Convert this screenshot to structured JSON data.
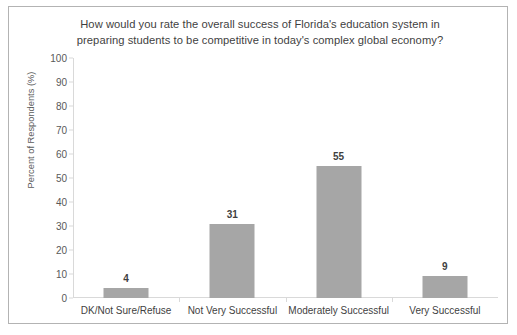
{
  "chart_data": {
    "type": "bar",
    "title": "How would you rate the overall success of Florida's education system in preparing students to be competitive in today's complex global economy?",
    "title_line1": "How would you rate the overall success of Florida's education system in",
    "title_line2": "preparing students to be competitive in today's complex global economy?",
    "categories": [
      "DK/Not Sure/Refuse",
      "Not Very Successful",
      "Moderately Successful",
      "Very Successful"
    ],
    "values": [
      4,
      31,
      55,
      9
    ],
    "value_labels": [
      "4",
      "31",
      "55",
      "9"
    ],
    "xlabel": "",
    "ylabel": "Percent of Respondents (%)",
    "ylim": [
      0,
      100
    ],
    "ytick_labels": [
      "100",
      "90",
      "80",
      "70",
      "60",
      "50",
      "40",
      "30",
      "20",
      "10",
      "0"
    ],
    "ytick_values": [
      100,
      90,
      80,
      70,
      60,
      50,
      40,
      30,
      20,
      10,
      0
    ],
    "grid": false,
    "legend": false,
    "legend_position": "none",
    "bar_color": "#a6a6a6",
    "axis_color": "#d9d9d9",
    "text_color": "#3f3f3f",
    "border_color": "#b3b3b3"
  }
}
